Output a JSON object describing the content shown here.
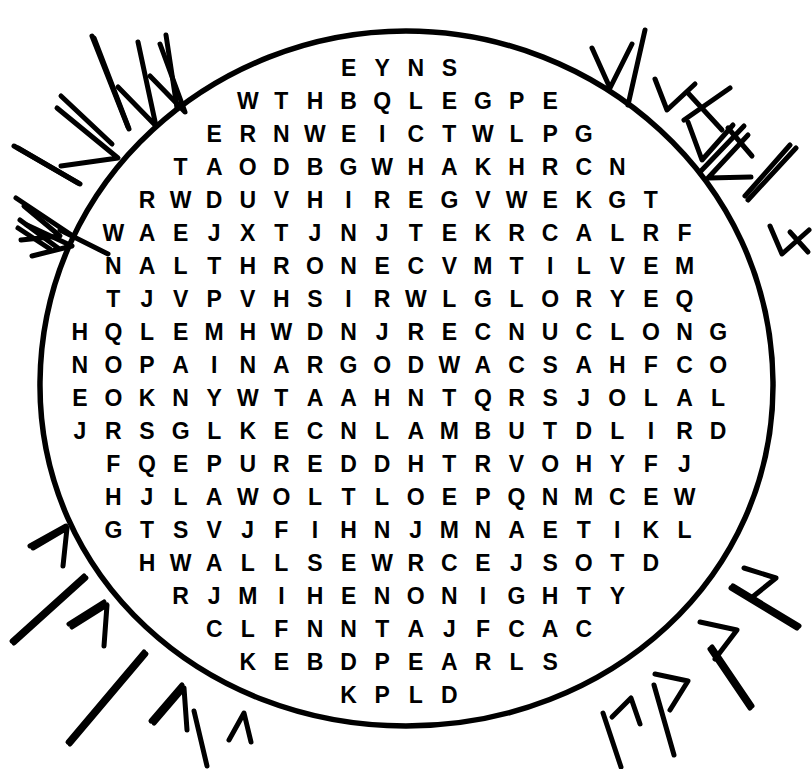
{
  "puzzle": {
    "type": "word-search",
    "shape": "circle",
    "title": "Word Search Puzzle",
    "ink_color": "#000000",
    "background_color": "#ffffff",
    "grid": {
      "columns": 21,
      "rows": 21,
      "cell_width": 33.6,
      "cell_height": 33,
      "origin_x": 63,
      "origin_y": 52,
      "font_size_px": 23
    },
    "rows": [
      {
        "index": 0,
        "start_col": 8,
        "letters": "EYNS"
      },
      {
        "index": 1,
        "start_col": 5,
        "letters": "WTHBQLEGPE"
      },
      {
        "index": 2,
        "start_col": 4,
        "letters": "ERNWEICTWLPG"
      },
      {
        "index": 3,
        "start_col": 3,
        "letters": "TAODBGWHAKHRCN"
      },
      {
        "index": 4,
        "start_col": 2,
        "letters": "RWDUVHIREGVWEKGT"
      },
      {
        "index": 5,
        "start_col": 1,
        "letters": "WAEJXTJNJTEKRCALRF"
      },
      {
        "index": 6,
        "start_col": 1,
        "letters": "NALTHRONECVMTILVEM"
      },
      {
        "index": 7,
        "start_col": 1,
        "letters": "TJVPVHSIRWLGLORYEQ"
      },
      {
        "index": 8,
        "start_col": 0,
        "letters": "HQLEMHWDNJRECNUCLONG"
      },
      {
        "index": 9,
        "start_col": 0,
        "letters": "NOPAINARGODWACSAHFCO"
      },
      {
        "index": 10,
        "start_col": 0,
        "letters": "EOKNYWTAAHNTQRSJOLAL"
      },
      {
        "index": 11,
        "start_col": 0,
        "letters": "JRSGLKECNLAMBUTDLIRD"
      },
      {
        "index": 12,
        "start_col": 1,
        "letters": "FQEPUREDDHTRVOHYFJ"
      },
      {
        "index": 13,
        "start_col": 1,
        "letters": "HJLAWOLTLOEPQNMCEW"
      },
      {
        "index": 14,
        "start_col": 1,
        "letters": "GTSVJFIHNJMNAETIKL"
      },
      {
        "index": 15,
        "start_col": 2,
        "letters": "HWALLSEWRCEJSOTD"
      },
      {
        "index": 16,
        "start_col": 3,
        "letters": "RJMIHENONIGHTY"
      },
      {
        "index": 17,
        "start_col": 4,
        "letters": "CLFNNTAJFCAC"
      },
      {
        "index": 18,
        "start_col": 5,
        "letters": "KEBDPEARLS"
      },
      {
        "index": 19,
        "start_col": 8,
        "letters": "KPLD"
      }
    ],
    "circle": {
      "center_x": 406,
      "center_y": 385,
      "radius_x": 365,
      "radius_y": 345,
      "stroke_width": 5
    },
    "rays": {
      "description": "hand-drawn chevron and line sunburst marks surrounding the circle",
      "count": 28
    }
  }
}
